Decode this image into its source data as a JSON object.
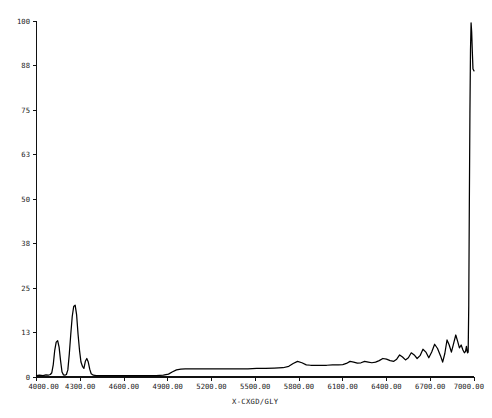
{
  "chart_data": {
    "type": "line",
    "title": "",
    "subtitle": "",
    "xlabel": "X-CXGD/GLY",
    "ylabel": "",
    "xlim": [
      4000.0,
      7000.0
    ],
    "ylim": [
      0,
      100
    ],
    "grid": false,
    "legend": null,
    "x_tick_labels": [
      "4000.00",
      "4300.00",
      "4600.00",
      "4900.00",
      "5200.00",
      "5500.00",
      "5800.00",
      "6100.00",
      "6400.00",
      "6700.00",
      "7000.00"
    ],
    "x_tick_values": [
      4000,
      4300,
      4600,
      4900,
      5200,
      5500,
      5800,
      6100,
      6400,
      6700,
      7000
    ],
    "y_tick_labels": [
      "0",
      "13",
      "25",
      "38",
      "50",
      "63",
      "75",
      "88",
      "100"
    ],
    "y_tick_values": [
      0,
      12.5,
      25,
      37.5,
      50,
      62.5,
      75,
      87.5,
      100
    ],
    "series": [
      {
        "name": "X-CXGD/GLY",
        "color": "#000000",
        "x": [
          4000,
          4020,
          4045,
          4065,
          4080,
          4095,
          4105,
          4115,
          4125,
          4135,
          4145,
          4155,
          4165,
          4175,
          4185,
          4195,
          4205,
          4215,
          4225,
          4235,
          4245,
          4255,
          4265,
          4275,
          4285,
          4295,
          4305,
          4315,
          4325,
          4335,
          4345,
          4355,
          4365,
          4375,
          4390,
          4410,
          4440,
          4480,
          4530,
          4580,
          4640,
          4700,
          4760,
          4820,
          4870,
          4905,
          4930,
          4960,
          4990,
          5020,
          5060,
          5110,
          5160,
          5210,
          5270,
          5330,
          5390,
          5450,
          5510,
          5570,
          5630,
          5690,
          5730,
          5760,
          5790,
          5820,
          5850,
          5880,
          5910,
          5950,
          5990,
          6030,
          6070,
          6100,
          6125,
          6150,
          6175,
          6200,
          6225,
          6250,
          6275,
          6300,
          6325,
          6350,
          6375,
          6400,
          6425,
          6450,
          6470,
          6490,
          6510,
          6530,
          6550,
          6570,
          6590,
          6610,
          6630,
          6650,
          6670,
          6690,
          6710,
          6730,
          6750,
          6770,
          6785,
          6800,
          6815,
          6830,
          6845,
          6860,
          6875,
          6888,
          6900,
          6912,
          6924,
          6934,
          6942,
          6948,
          6952,
          6956,
          6960,
          6964,
          6968,
          6972,
          6976,
          6980,
          6984,
          6988,
          6993,
          7000
        ],
        "y": [
          0.4,
          0.5,
          0.4,
          0.6,
          0.5,
          0.7,
          1.2,
          3.5,
          7.5,
          9.8,
          10.2,
          8.4,
          4.6,
          1.4,
          0.6,
          0.5,
          0.7,
          2.0,
          6.5,
          12.0,
          17.0,
          19.8,
          20.2,
          17.5,
          12.0,
          7.5,
          4.2,
          3.0,
          2.4,
          4.4,
          5.2,
          4.2,
          2.2,
          0.9,
          0.5,
          0.4,
          0.4,
          0.4,
          0.4,
          0.4,
          0.4,
          0.4,
          0.4,
          0.4,
          0.5,
          0.8,
          1.4,
          2.0,
          2.2,
          2.3,
          2.3,
          2.3,
          2.3,
          2.3,
          2.3,
          2.3,
          2.3,
          2.3,
          2.4,
          2.4,
          2.5,
          2.6,
          3.0,
          3.8,
          4.4,
          4.0,
          3.4,
          3.3,
          3.3,
          3.3,
          3.3,
          3.4,
          3.4,
          3.5,
          3.8,
          4.4,
          4.2,
          3.9,
          4.0,
          4.4,
          4.2,
          4.0,
          4.2,
          4.6,
          5.2,
          5.0,
          4.6,
          4.4,
          5.0,
          6.2,
          5.6,
          4.8,
          5.4,
          6.8,
          6.2,
          5.2,
          6.0,
          7.8,
          7.0,
          5.4,
          7.0,
          9.2,
          8.0,
          6.0,
          4.2,
          6.6,
          10.4,
          9.0,
          7.0,
          9.4,
          11.8,
          10.0,
          8.2,
          9.0,
          7.6,
          6.8,
          7.2,
          8.6,
          7.4,
          6.8,
          7.0,
          20.0,
          48.0,
          74.0,
          92.0,
          99.5,
          97.0,
          92.0,
          86.5,
          86.0
        ]
      }
    ],
    "annotations": []
  },
  "axes": {
    "x_axis_title": "X-CXGD/GLY",
    "y_axis_title": ""
  }
}
